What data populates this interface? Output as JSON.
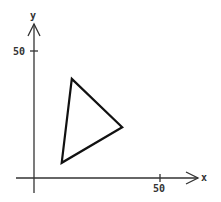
{
  "chart_data": {
    "type": "scatter",
    "title": "",
    "xlabel": "x",
    "ylabel": "y",
    "x_ticks": [
      50
    ],
    "y_ticks": [
      50
    ],
    "xlim": [
      -3,
      65
    ],
    "ylim": [
      -4,
      62
    ],
    "grid": false,
    "shapes": [
      {
        "type": "triangle",
        "vertices": [
          [
            15,
            39
          ],
          [
            35,
            20
          ],
          [
            11,
            6
          ]
        ],
        "stroke": "#111111",
        "fill": "none"
      }
    ]
  },
  "axes": {
    "x_label": "x",
    "y_label": "y",
    "x_tick_label": "50",
    "y_tick_label": "50",
    "color": "#333333"
  }
}
